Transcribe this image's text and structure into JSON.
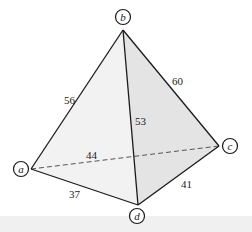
{
  "diagram": {
    "type": "tetrahedron-graph",
    "colors": {
      "edge": "#1a1a1a",
      "hidden_edge": "#555555",
      "face_front_left": "#f2f2f2",
      "face_front_right": "#e4e4e4",
      "background": "#ffffff",
      "bottom_strip": "#f0f0f0"
    },
    "vertices": [
      {
        "id": "a",
        "label": "a",
        "x": 31,
        "y": 169,
        "cx": 21,
        "cy": 169
      },
      {
        "id": "b",
        "label": "b",
        "x": 123,
        "y": 30,
        "cx": 123,
        "cy": 17
      },
      {
        "id": "c",
        "label": "c",
        "x": 219,
        "y": 146,
        "cx": 230,
        "cy": 146
      },
      {
        "id": "d",
        "label": "d",
        "x": 138,
        "y": 205,
        "cx": 137,
        "cy": 216
      }
    ],
    "edges": [
      {
        "from": "a",
        "to": "b",
        "weight": "56",
        "hidden": false,
        "lx": 66,
        "ly": 102
      },
      {
        "from": "b",
        "to": "c",
        "weight": "60",
        "hidden": false,
        "lx": 177,
        "ly": 84
      },
      {
        "from": "b",
        "to": "d",
        "weight": "53",
        "hidden": false,
        "lx": 141,
        "ly": 123
      },
      {
        "from": "a",
        "to": "c",
        "weight": "44",
        "hidden": true,
        "lx": 90,
        "ly": 158
      },
      {
        "from": "a",
        "to": "d",
        "weight": "37",
        "hidden": false,
        "lx": 76,
        "ly": 197
      },
      {
        "from": "c",
        "to": "d",
        "weight": "41",
        "hidden": false,
        "lx": 186,
        "ly": 187
      }
    ]
  }
}
